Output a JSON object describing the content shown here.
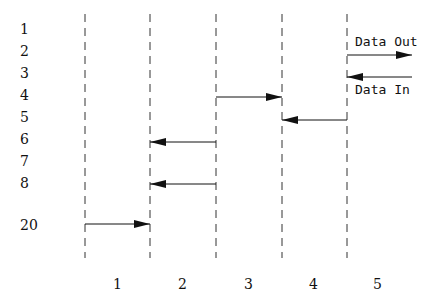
{
  "diagram": {
    "type": "timing-sequence",
    "columns": [
      {
        "label": "1",
        "x": 85
      },
      {
        "label": "2",
        "x": 150
      },
      {
        "label": "3",
        "x": 216
      },
      {
        "label": "4",
        "x": 282
      },
      {
        "label": "5",
        "x": 347
      }
    ],
    "rows": [
      {
        "label": "1",
        "y": 33
      },
      {
        "label": "2",
        "y": 55
      },
      {
        "label": "3",
        "y": 77
      },
      {
        "label": "4",
        "y": 97
      },
      {
        "label": "5",
        "y": 120
      },
      {
        "label": "6",
        "y": 142
      },
      {
        "label": "7",
        "y": 162
      },
      {
        "label": "8",
        "y": 184
      },
      {
        "label": "20",
        "y": 224
      }
    ],
    "arrows": [
      {
        "row": "2",
        "from_x": 347,
        "to_x": 412,
        "direction": "right",
        "label": "Data Out"
      },
      {
        "row": "3",
        "from_x": 412,
        "to_x": 347,
        "direction": "left",
        "label": "Data In"
      },
      {
        "row": "4",
        "from_col": "3",
        "to_col": "4",
        "direction": "right"
      },
      {
        "row": "5",
        "from_col": "5",
        "to_col": "4",
        "direction": "left"
      },
      {
        "row": "6",
        "from_col": "3",
        "to_col": "2",
        "direction": "left"
      },
      {
        "row": "8",
        "from_col": "3",
        "to_col": "2",
        "direction": "left"
      },
      {
        "row": "20",
        "from_col": "1",
        "to_col": "2",
        "direction": "right"
      }
    ],
    "annotations": {
      "data_out": "Data Out",
      "data_in": "Data In"
    }
  }
}
